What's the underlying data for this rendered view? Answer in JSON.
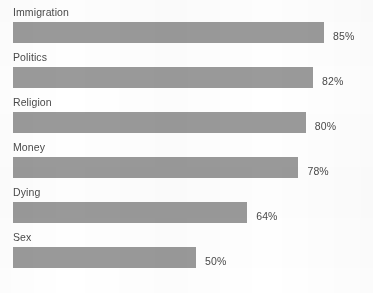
{
  "chart_data": {
    "type": "bar",
    "orientation": "horizontal",
    "title": "",
    "subtitle": "",
    "xlabel": "",
    "ylabel": "",
    "grid": false,
    "legend": false,
    "xlim": [
      0,
      100
    ],
    "categories": [
      "Immigration",
      "Politics",
      "Religion",
      "Money",
      "Dying",
      "Sex"
    ],
    "values": [
      85,
      82,
      80,
      78,
      64,
      50
    ],
    "value_labels": [
      "85%",
      "82%",
      "80%",
      "78%",
      "64%",
      "50%"
    ],
    "units": "percent",
    "bar_color": "#9a9a9a",
    "text_color": "#4a4a4a",
    "background_color": "#ffffff"
  }
}
